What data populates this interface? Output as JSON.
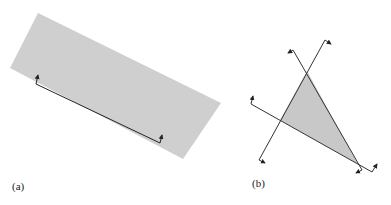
{
  "figure": {
    "panels": [
      {
        "id": "a",
        "label": "(a)",
        "shape": "rectangle",
        "fill": "#cfcfcf",
        "polygon": [
          [
            38,
            13
          ],
          [
            221,
            103
          ],
          [
            183,
            159
          ],
          [
            10,
            68
          ]
        ],
        "edge_line": {
          "from": [
            36,
            84
          ],
          "to": [
            160,
            143
          ],
          "stroke": "#222222"
        },
        "arrows": [
          {
            "base": [
              36,
              84
            ],
            "tip": [
              38,
              74
            ]
          },
          {
            "base": [
              160,
              143
            ],
            "tip": [
              163,
              134
            ]
          }
        ]
      },
      {
        "id": "b",
        "label": "(b)",
        "shape": "triangle",
        "fill": "#c8c8c8",
        "polygon": [
          [
            307,
            71
          ],
          [
            280,
            120
          ],
          [
            358,
            164
          ]
        ],
        "lines": [
          {
            "from": [
              293,
              50
            ],
            "to": [
              362,
              170
            ],
            "stroke": "#333333"
          },
          {
            "from": [
              325,
              40
            ],
            "to": [
              259,
              160
            ],
            "stroke": "#333333"
          },
          {
            "from": [
              251,
              104
            ],
            "to": [
              372,
              172
            ],
            "stroke": "#333333"
          }
        ],
        "arrows": [
          {
            "base": [
              293,
              50
            ],
            "tip": [
              287,
              54
            ]
          },
          {
            "base": [
              325,
              40
            ],
            "tip": [
              332,
              44
            ]
          },
          {
            "base": [
              251,
              104
            ],
            "tip": [
              253,
              95
            ]
          },
          {
            "base": [
              259,
              160
            ],
            "tip": [
              266,
              163
            ]
          },
          {
            "base": [
              372,
              172
            ],
            "tip": [
              378,
              163
            ]
          },
          {
            "base": [
              362,
              170
            ],
            "tip": [
              355,
              174
            ]
          }
        ]
      }
    ]
  },
  "colors": {
    "background": "#ffffff",
    "stroke": "#2a2a2a"
  }
}
